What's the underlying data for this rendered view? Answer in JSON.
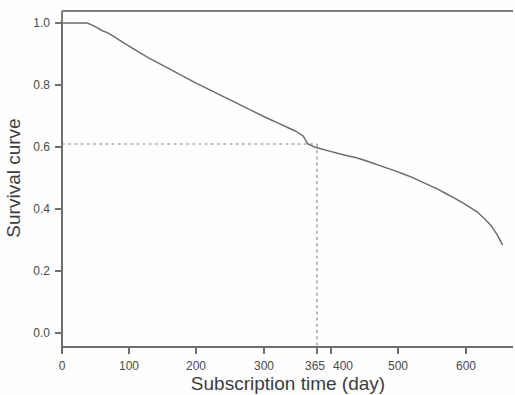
{
  "chart_data": {
    "type": "line",
    "title": "",
    "xlabel": "Subscription time (day)",
    "ylabel": "Survival curve",
    "xlim": [
      0,
      670
    ],
    "ylim": [
      0.0,
      1.04
    ],
    "grid": false,
    "legend": null,
    "xticks": [
      0,
      100,
      200,
      300,
      365,
      400,
      500,
      600
    ],
    "xticklabels": [
      "0",
      "100",
      "200",
      "300",
      "365",
      "400",
      "500",
      "600"
    ],
    "yticks": [
      0.0,
      0.2,
      0.4,
      0.6,
      0.8,
      1.0
    ],
    "yticklabels": [
      "0.0",
      "0.2",
      "0.4",
      "0.6",
      "0.8",
      "1.0"
    ],
    "series": [
      {
        "name": "Survival curve",
        "color": "#6b6b6b",
        "x": [
          0,
          18,
          30,
          37,
          45,
          52,
          60,
          68,
          78,
          90,
          102,
          115,
          128,
          142,
          156,
          170,
          185,
          200,
          215,
          230,
          245,
          258,
          272,
          285,
          298,
          310,
          322,
          335,
          348,
          358,
          365,
          375,
          388,
          400,
          412,
          424,
          436,
          448,
          460,
          472,
          484,
          496,
          508,
          520,
          532,
          545,
          558,
          570,
          582,
          594,
          606,
          618,
          628,
          638,
          646,
          654
        ],
        "y": [
          1.0,
          1.0,
          1.0,
          1.0,
          0.993,
          0.985,
          0.975,
          0.968,
          0.955,
          0.938,
          0.922,
          0.905,
          0.888,
          0.872,
          0.856,
          0.84,
          0.822,
          0.805,
          0.789,
          0.773,
          0.757,
          0.743,
          0.728,
          0.714,
          0.7,
          0.688,
          0.676,
          0.663,
          0.65,
          0.636,
          0.61,
          0.6,
          0.592,
          0.585,
          0.578,
          0.572,
          0.566,
          0.558,
          0.549,
          0.54,
          0.531,
          0.522,
          0.512,
          0.502,
          0.49,
          0.477,
          0.464,
          0.45,
          0.436,
          0.421,
          0.405,
          0.388,
          0.368,
          0.344,
          0.318,
          0.285
        ]
      }
    ],
    "annotations": [
      {
        "name": "reference-marker",
        "x": 365,
        "y": 0.61,
        "style": "dashed-crosshair",
        "color": "#8a8a8a"
      }
    ]
  },
  "axes": {
    "x_title": "Subscription time (day)",
    "y_title": "Survival curve"
  }
}
